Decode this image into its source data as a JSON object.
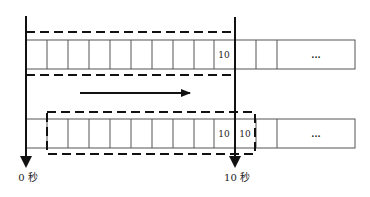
{
  "diagram": {
    "type": "sliding-window-timeline",
    "direction_arrow": "right",
    "axes": [
      {
        "id": "start",
        "label": "0 秒"
      },
      {
        "id": "end",
        "label": "10 秒"
      }
    ],
    "rows": [
      {
        "id": "row-1",
        "cells": [
          "",
          "",
          "",
          "",
          "",
          "",
          "",
          "",
          "",
          "10",
          "",
          "",
          "..."
        ],
        "window": {
          "style": "dashed",
          "covers": "cells 0-9"
        }
      },
      {
        "id": "row-2",
        "cells": [
          "",
          "",
          "",
          "",
          "",
          "",
          "",
          "",
          "",
          "10",
          "10",
          "",
          "..."
        ],
        "window": {
          "style": "dashed",
          "covers": "cells 1-10"
        }
      }
    ],
    "colors": {
      "stroke": "#111111",
      "cell_border": "#555555",
      "background": "#ffffff"
    }
  }
}
